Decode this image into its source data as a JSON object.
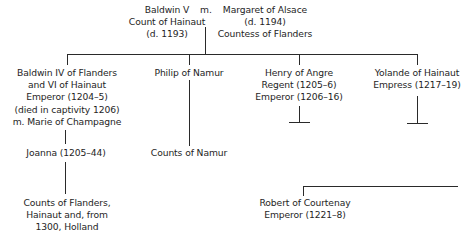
{
  "diagram": {
    "type": "family-tree",
    "parents": {
      "father": {
        "lines": [
          "Baldwin V",
          "Count of Hainaut",
          "(d. 1193)"
        ]
      },
      "marriage_label": "m.",
      "mother": {
        "lines": [
          "Margaret of Alsace",
          "(d. 1194)",
          "Countess of Flanders"
        ]
      }
    },
    "children": [
      {
        "lines": [
          "Baldwin IV of Flanders",
          "and VI of Hainaut",
          "Emperor (1204–5)",
          "(died in captivity 1206)",
          "m. Marie of Champagne"
        ]
      },
      {
        "lines": [
          "Philip of Namur"
        ]
      },
      {
        "lines": [
          "Henry of Angre",
          "Regent (1205–6)",
          "Emperor (1206–16)"
        ]
      },
      {
        "lines": [
          "Yolande of Hainaut",
          "Empress (1217–19)"
        ]
      }
    ],
    "descendants": {
      "joanna": {
        "lines": [
          "Joanna (1205–44)"
        ]
      },
      "flanders_counts": {
        "lines": [
          "Counts of Flanders,",
          "Hainaut and, from",
          "1300, Holland"
        ]
      },
      "namur_counts": {
        "lines": [
          "Counts of Namur"
        ]
      },
      "robert": {
        "lines": [
          "Robert of Courtenay",
          "Emperor (1221–8)"
        ]
      }
    }
  }
}
